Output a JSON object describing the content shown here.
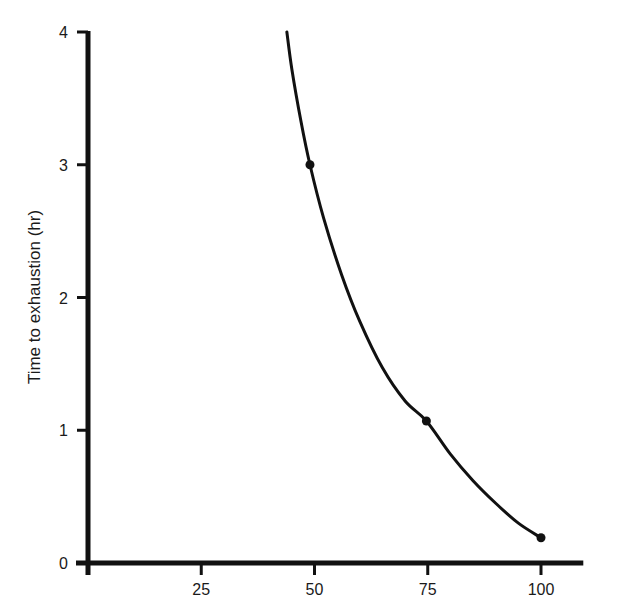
{
  "chart_data": {
    "type": "line",
    "title": "",
    "xlabel": "",
    "ylabel": "Time to exhaustion (hr)",
    "xlim": [
      0,
      110
    ],
    "ylim": [
      0,
      4
    ],
    "x_ticks": [
      25,
      50,
      75,
      100
    ],
    "x_tick_labels": [
      "25",
      "50",
      "75",
      "100"
    ],
    "y_ticks": [
      0,
      1,
      2,
      3,
      4
    ],
    "y_tick_labels": [
      "0",
      "1",
      "2",
      "3",
      "4"
    ],
    "grid": false,
    "legend": null,
    "series": [
      {
        "name": "fitted-curve",
        "x": [
          43.9,
          45,
          47,
          49,
          52,
          56,
          60,
          65,
          70,
          74.7,
          80,
          85,
          90,
          95,
          100
        ],
        "y": [
          4.0,
          3.72,
          3.33,
          3.0,
          2.6,
          2.17,
          1.82,
          1.47,
          1.22,
          1.07,
          0.82,
          0.62,
          0.45,
          0.3,
          0.19
        ]
      }
    ],
    "points": [
      {
        "x": 49,
        "y": 3.0
      },
      {
        "x": 74.7,
        "y": 1.07
      },
      {
        "x": 100,
        "y": 0.19
      }
    ],
    "line_color": "#111111"
  }
}
